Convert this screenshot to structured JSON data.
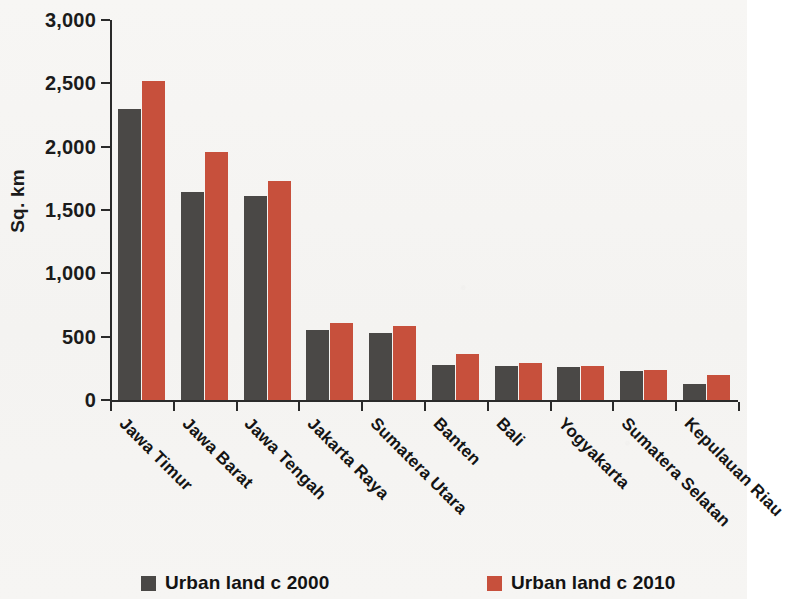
{
  "chart_data": {
    "type": "bar",
    "title": "",
    "xlabel": "",
    "ylabel": "Sq. km",
    "ylim": [
      0,
      3000
    ],
    "yticks": [
      0,
      500,
      1000,
      1500,
      2000,
      2500,
      3000
    ],
    "ytick_labels": [
      "0",
      "500",
      "1,000",
      "1,500",
      "2,000",
      "2,500",
      "3,000"
    ],
    "grid": false,
    "legend_position": "bottom",
    "categories": [
      "Jawa Timur",
      "Jawa Barat",
      "Jawa Tengah",
      "Jakarta Raya",
      "Sumatera Utara",
      "Banten",
      "Bali",
      "Yogyakarta",
      "Sumatera Selatan",
      "Kepulauan Riau"
    ],
    "series": [
      {
        "name": "Urban land c 2000",
        "color": "#4a4846",
        "values": [
          2300,
          1640,
          1610,
          550,
          530,
          275,
          270,
          260,
          230,
          125
        ]
      },
      {
        "name": "Urban land c 2010",
        "color": "#c7503c",
        "values": [
          2520,
          1960,
          1730,
          610,
          585,
          365,
          290,
          265,
          235,
          200
        ]
      }
    ]
  },
  "legend": {
    "items": [
      {
        "label": "Urban land c 2000",
        "color": "#4a4846"
      },
      {
        "label": "Urban land c 2010",
        "color": "#c7503c"
      }
    ]
  }
}
